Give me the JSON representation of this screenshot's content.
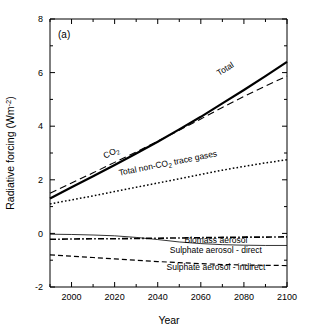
{
  "figure": {
    "panel_label": "(a)",
    "background_color": "#ffffff",
    "line_color": "#000000"
  },
  "chart_data": {
    "type": "line",
    "title": "",
    "panel": "(a)",
    "xlabel": "Year",
    "ylabel": "Radiative forcing (Wm⁻²)",
    "xlim": [
      1990,
      2100
    ],
    "ylim": [
      -2,
      8
    ],
    "xticks": [
      2000,
      2020,
      2040,
      2060,
      2080,
      2100
    ],
    "xticklabels": [
      "2000",
      "2020",
      "2040",
      "2060",
      "2080",
      "2100"
    ],
    "yticks": [
      -2,
      0,
      2,
      4,
      6,
      8
    ],
    "yticklabels": [
      "-2",
      "0",
      "2",
      "4",
      "6",
      "8"
    ],
    "minor_xtick_interval": 10,
    "minor_ytick_interval": 1,
    "grid": false,
    "legend": "inline-labels",
    "x": [
      1990,
      2000,
      2010,
      2020,
      2030,
      2040,
      2050,
      2060,
      2070,
      2080,
      2090,
      2100
    ],
    "series": [
      {
        "name": "Total",
        "label": "Total",
        "style": "thick-solid",
        "linewidth": 2.2,
        "dash": "none",
        "values": [
          1.3,
          1.72,
          2.13,
          2.55,
          2.98,
          3.42,
          3.88,
          4.35,
          4.85,
          5.35,
          5.87,
          6.4
        ],
        "label_x": 2072,
        "label_y": 6.05
      },
      {
        "name": "CO2",
        "label": "CO₂",
        "style": "dashed",
        "linewidth": 1.1,
        "dash": "7,4",
        "values": [
          1.5,
          1.88,
          2.26,
          2.65,
          3.04,
          3.44,
          3.85,
          4.27,
          4.7,
          5.11,
          5.5,
          5.87
        ],
        "label_x": 2019,
        "label_y": 2.92
      },
      {
        "name": "Total non-CO2 trace gases",
        "label": "Total non-CO₂ trace gases",
        "style": "dotted",
        "linewidth": 1.5,
        "dash": "1.6,2.2",
        "values": [
          1.1,
          1.25,
          1.4,
          1.56,
          1.72,
          1.88,
          2.04,
          2.2,
          2.36,
          2.5,
          2.63,
          2.75
        ],
        "label_x": 2045,
        "label_y": 2.52
      },
      {
        "name": "Biomass aerosol",
        "label": "Biomass aerosol",
        "style": "dash-dot",
        "linewidth": 1.6,
        "dash": "6,2.2,1.6,2.2",
        "values": [
          -0.22,
          -0.21,
          -0.2,
          -0.2,
          -0.19,
          -0.18,
          -0.17,
          -0.16,
          -0.15,
          -0.14,
          -0.14,
          -0.13
        ],
        "label_x": 2067,
        "label_y": -0.36
      },
      {
        "name": "Sulphate aerosol - direct",
        "label": "Sulphate aerosol - direct",
        "style": "thin-solid",
        "linewidth": 0.8,
        "dash": "none",
        "values": [
          -0.03,
          -0.04,
          -0.06,
          -0.09,
          -0.15,
          -0.23,
          -0.32,
          -0.38,
          -0.42,
          -0.44,
          -0.45,
          -0.45
        ],
        "label_x": 2067,
        "label_y": -0.72
      },
      {
        "name": "Sulphate aerosol - indirect",
        "label": "Sulphate aerosol - indirect",
        "style": "dashed",
        "linewidth": 1.2,
        "dash": "5,3",
        "values": [
          -0.8,
          -0.85,
          -0.9,
          -0.95,
          -1.0,
          -1.05,
          -1.09,
          -1.13,
          -1.16,
          -1.18,
          -1.19,
          -1.2
        ],
        "label_x": 2067,
        "label_y": -1.37
      }
    ]
  }
}
